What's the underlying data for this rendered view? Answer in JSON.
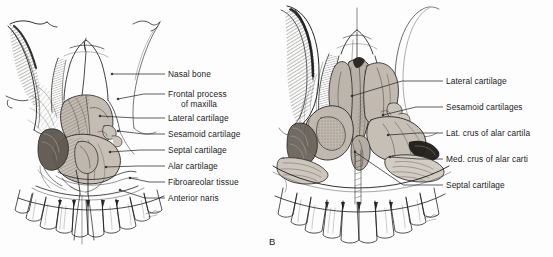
{
  "figure": {
    "background_color": "#fdfdfd",
    "ink_color": "#1b1b1b",
    "cartilage_fill": "#bdb5ab",
    "cartilage_fill_light": "#cfc8bf",
    "bone_fill": "#ffffff",
    "leader_color": "#2a2a2a",
    "panel_letter_b": "B"
  },
  "panel_a": {
    "name": "anterior view of nasal skeleton with cartilages in situ",
    "labels": [
      {
        "id": "nasal-bone",
        "text": "Nasal bone",
        "line2": "",
        "x": 168,
        "y": 69,
        "leader_x1": 112,
        "leader_y1": 74,
        "leader_x2": 165,
        "leader_y2": 74
      },
      {
        "id": "frontal-process",
        "text": "Frontal process",
        "line2": "of maxilla",
        "x": 168,
        "y": 89,
        "leader_x1": 118,
        "leader_y1": 99,
        "leader_x2": 165,
        "leader_y2": 94
      },
      {
        "id": "lateral-cartilage",
        "text": "Lateral cartilage",
        "line2": "",
        "x": 168,
        "y": 113,
        "leader_x1": 100,
        "leader_y1": 116,
        "leader_x2": 165,
        "leader_y2": 118
      },
      {
        "id": "sesamoid-cartilage",
        "text": "Sesamoid cartilage",
        "line2": "",
        "x": 168,
        "y": 129,
        "leader_x1": 118,
        "leader_y1": 131,
        "leader_x2": 165,
        "leader_y2": 134
      },
      {
        "id": "septal-cartilage",
        "text": "Septal cartilage",
        "line2": "",
        "x": 168,
        "y": 145,
        "leader_x1": 110,
        "leader_y1": 152,
        "leader_x2": 165,
        "leader_y2": 150
      },
      {
        "id": "alar-cartilage",
        "text": "Alar cartilage",
        "line2": "",
        "x": 168,
        "y": 161,
        "leader_x1": 106,
        "leader_y1": 167,
        "leader_x2": 165,
        "leader_y2": 166
      },
      {
        "id": "fibroareolar-tissue",
        "text": "Fibroareolar tissue",
        "line2": "",
        "x": 168,
        "y": 177,
        "leader_x1": 130,
        "leader_y1": 178,
        "leader_x2": 165,
        "leader_y2": 182
      },
      {
        "id": "anterior-naris",
        "text": "Anterior naris",
        "line2": "",
        "x": 168,
        "y": 193,
        "leader_x1": 120,
        "leader_y1": 190,
        "leader_x2": 165,
        "leader_y2": 198
      }
    ]
  },
  "panel_b": {
    "name": "anterior view of dissected nasal cartilages",
    "letter": "B",
    "letter_x": 269,
    "letter_y": 236,
    "labels": [
      {
        "id": "lateral-cartilage",
        "text": "Lateral cartilage",
        "x": 446,
        "y": 76,
        "leader_x1": 352,
        "leader_y1": 96,
        "leader_x2": 443,
        "leader_y2": 81
      },
      {
        "id": "sesamoid-cartilages",
        "text": "Sesamoid cartilages",
        "x": 446,
        "y": 102,
        "leader_x1": 383,
        "leader_y1": 115,
        "leader_x2": 443,
        "leader_y2": 107
      },
      {
        "id": "lat-crus-alar",
        "text": "Lat. crus of alar cartila",
        "x": 446,
        "y": 128,
        "leader_x1": 388,
        "leader_y1": 135,
        "leader_x2": 443,
        "leader_y2": 133
      },
      {
        "id": "med-crus-alar",
        "text": "Med. crus of alar carti",
        "x": 446,
        "y": 154,
        "leader_x1": 390,
        "leader_y1": 157,
        "leader_x2": 443,
        "leader_y2": 159
      },
      {
        "id": "septal-cartilage",
        "text": "Septal cartilage",
        "x": 446,
        "y": 180,
        "leader_x1": 355,
        "leader_y1": 152,
        "leader_x2": 443,
        "leader_y2": 185
      }
    ]
  }
}
